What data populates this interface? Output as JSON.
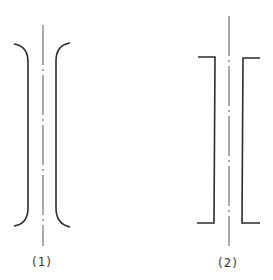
{
  "figures": [
    {
      "id": "1",
      "label": "(1)",
      "shape": "rounded-flange-brackets",
      "centerline_style": "dash-dot"
    },
    {
      "id": "2",
      "label": "(2)",
      "shape": "square-flange-brackets",
      "centerline_style": "dash-dot"
    }
  ],
  "colors": {
    "stroke": "#2b2b2b",
    "centerline": "#555555",
    "background": "#ffffff"
  }
}
